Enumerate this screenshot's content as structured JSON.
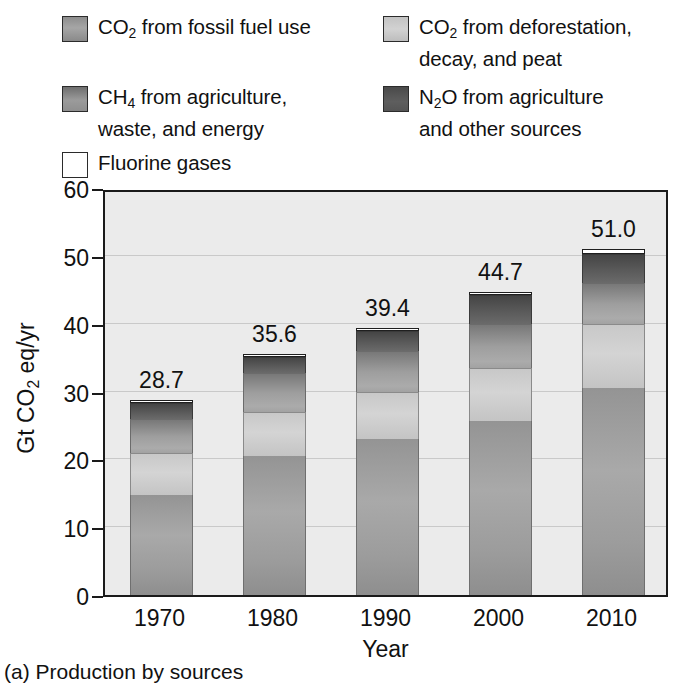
{
  "legend": {
    "items": [
      {
        "id": "co2-fossil",
        "label": "CO2 from fossil fuel use",
        "label_parts": [
          "CO",
          "2",
          " from fossil fuel use"
        ],
        "color": "#9c9c9c",
        "swatch": "sw-fossil"
      },
      {
        "id": "co2-defor",
        "label": "CO2 from deforestation, decay, and peat",
        "label_parts": [
          "CO",
          "2",
          " from deforestation,\ndecay, and peat"
        ],
        "color": "#cccccc",
        "swatch": "sw-defor"
      },
      {
        "id": "ch4",
        "label": "CH4 from agriculture, waste, and energy",
        "label_parts": [
          "CH",
          "4",
          " from agriculture,\nwaste, and energy"
        ],
        "color": "#8f8f8f",
        "swatch": "sw-ch4"
      },
      {
        "id": "n2o",
        "label": "N2O from agriculture and other sources",
        "label_parts": [
          "N",
          "2",
          "O from agriculture\nand other sources"
        ],
        "color": "#525252",
        "swatch": "sw-n2o"
      },
      {
        "id": "fluorine",
        "label": "Fluorine gases",
        "label_parts": [
          "Fluorine gases",
          "",
          ""
        ],
        "color": "#ffffff",
        "swatch": "sw-fgas"
      }
    ]
  },
  "caption": "(a) Production by sources",
  "chart_data": {
    "type": "bar",
    "subtype": "stacked-bar",
    "title": "",
    "xlabel": "Year",
    "ylabel": "Gt CO2 eq/yr",
    "ylabel_parts": [
      "Gt CO",
      "2",
      " eq/yr"
    ],
    "categories": [
      "1970",
      "1980",
      "1990",
      "2000",
      "2010"
    ],
    "ylim": [
      0,
      60
    ],
    "yticks": [
      0,
      10,
      20,
      30,
      40,
      50,
      60
    ],
    "grid": true,
    "legend_position": "above",
    "totals": [
      28.7,
      35.6,
      39.4,
      44.7,
      51.0
    ],
    "total_labels": [
      "28.7",
      "35.6",
      "39.4",
      "44.7",
      "51.0"
    ],
    "series": [
      {
        "name": "CO2 from fossil fuel use",
        "key": "fossil",
        "values": [
          14.8,
          20.5,
          23.0,
          25.6,
          30.5
        ]
      },
      {
        "name": "CO2 from deforestation, decay, and peat",
        "key": "defor",
        "values": [
          6.2,
          6.5,
          7.0,
          7.9,
          9.5
        ]
      },
      {
        "name": "CH4 from agriculture, waste, and energy",
        "key": "ch4",
        "values": [
          5.0,
          5.8,
          6.0,
          6.5,
          6.0
        ]
      },
      {
        "name": "N2O from agriculture and other sources",
        "key": "n2o",
        "values": [
          2.3,
          2.3,
          2.9,
          4.2,
          4.3
        ]
      },
      {
        "name": "Fluorine gases",
        "key": "fgas",
        "values": [
          0.4,
          0.5,
          0.5,
          0.5,
          0.7
        ]
      }
    ]
  }
}
